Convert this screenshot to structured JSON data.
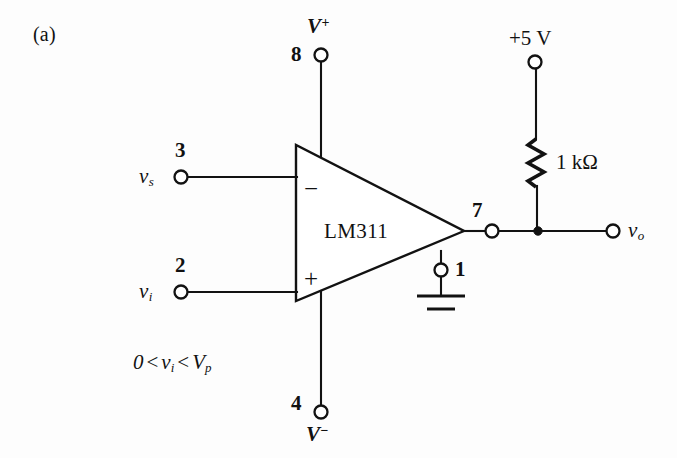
{
  "figure": {
    "panel_label": "(a)",
    "component": {
      "part_number": "LM311",
      "inverting_sign": "−",
      "noninverting_sign": "+"
    },
    "terminals": [
      {
        "id": "v-plus-supply",
        "pin": "8",
        "label": "V",
        "superscript": "+",
        "description": "positive supply terminal"
      },
      {
        "id": "inverting-input",
        "pin": "3",
        "label": "v",
        "subscript": "s",
        "description": "inverting input terminal"
      },
      {
        "id": "noninverting-input",
        "pin": "2",
        "label": "v",
        "subscript": "i",
        "description": "non-inverting input terminal"
      },
      {
        "id": "ground-pin",
        "pin": "1",
        "label": "",
        "description": "ground terminal"
      },
      {
        "id": "v-minus-supply",
        "pin": "4",
        "label": "V",
        "superscript": "−",
        "description": "negative supply terminal"
      },
      {
        "id": "output",
        "pin": "7",
        "label": "",
        "description": "open-collector output terminal"
      },
      {
        "id": "output-node",
        "pin": "",
        "label": "v",
        "subscript": "o",
        "description": "output voltage node"
      }
    ],
    "pullup": {
      "source_label": "+5 V",
      "resistor_value": "1 kΩ"
    },
    "condition": {
      "lhs": "0",
      "op1": "<",
      "mid": "v",
      "mid_sub": "i",
      "op2": "<",
      "rhs": "V",
      "rhs_sub": "p",
      "full_text": "0 < v_i < V_p"
    },
    "colors": {
      "ink": "#121212",
      "background": "#ffffff"
    }
  }
}
